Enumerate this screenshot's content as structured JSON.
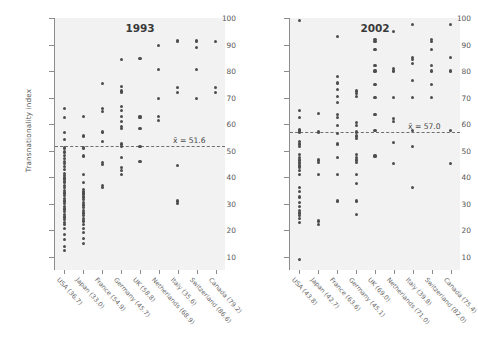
{
  "figure": {
    "ylabel": "Transnationality index",
    "y_ticks": [
      10,
      20,
      30,
      40,
      50,
      60,
      70,
      80,
      90,
      100
    ]
  },
  "chart_data": {
    "type": "scatter",
    "xlabel": "",
    "ylabel": "Transnationality index",
    "ylim": [
      5,
      100
    ],
    "grid": false,
    "legend": "none",
    "panels": [
      {
        "title": "1993",
        "mean": 51.6,
        "mean_label": "x̄ = 51.6",
        "categories": [
          "USA (36.7)",
          "Japan (33.0)",
          "France (54.9)",
          "Germany (45.7)",
          "UK (58.8)",
          "Netherlands (68.9)",
          "Italy (35.6)",
          "Switzerland (86.6)",
          "Canada (79.2)"
        ],
        "series": [
          {
            "name": "USA (36.7)",
            "values": [
              66.0,
              62.5,
              56.8,
              54.2,
              51.0,
              49.5,
              48.3,
              47.0,
              46.0,
              45.0,
              44.0,
              43.0,
              41.5,
              40.5,
              40.0,
              39.5,
              39.0,
              38.2,
              37.0,
              36.0,
              35.0,
              34.0,
              33.2,
              32.0,
              31.0,
              30.0,
              29.0,
              28.0,
              27.0,
              26.0,
              25.0,
              24.0,
              23.0,
              22.0,
              20.5,
              18.5,
              16.5,
              14.0,
              12.5
            ]
          },
          {
            "name": "Japan (33.0)",
            "values": [
              63.0,
              55.5,
              51.0,
              48.0,
              41.0,
              38.0,
              35.5,
              34.5,
              34.0,
              33.5,
              32.5,
              31.5,
              30.5,
              29.5,
              28.5,
              27.5,
              26.5,
              25.5,
              24.5,
              23.5,
              22.0,
              20.5,
              19.0,
              17.0,
              15.0
            ]
          },
          {
            "name": "France (54.9)",
            "values": [
              75.4,
              66.0,
              64.8,
              57.0,
              53.5,
              45.5,
              44.8,
              37.0,
              36.0
            ]
          },
          {
            "name": "Germany (45.7)",
            "values": [
              84.3,
              74.3,
              72.5,
              71.8,
              66.5,
              65.0,
              63.0,
              61.0,
              59.0,
              58.2,
              52.5,
              51.5,
              47.5,
              43.5,
              42.5,
              41.0
            ]
          },
          {
            "name": "UK (58.8)",
            "values": [
              84.6,
              63.0,
              62.5,
              58.3,
              51.5,
              45.8
            ]
          },
          {
            "name": "Netherlands (68.9)",
            "values": [
              89.5,
              80.6,
              69.5,
              63.0,
              61.5
            ]
          },
          {
            "name": "Italy (35.6)",
            "values": [
              91.5,
              91.0,
              73.9,
              72.0,
              44.5,
              31.0,
              30.0
            ]
          },
          {
            "name": "Switzerland (86.6)",
            "values": [
              91.5,
              91.0,
              89.0,
              80.6,
              69.5
            ]
          },
          {
            "name": "Canada (79.2)",
            "values": [
              91.0,
              73.9,
              72.0
            ]
          }
        ]
      },
      {
        "title": "2002",
        "mean": 57.0,
        "mean_label": "x̄ = 57.0",
        "categories": [
          "USA (43.8)",
          "Japan (42.7)",
          "France (63.6)",
          "Germany (45.1)",
          "UK (69.0)",
          "Netherlands (71.0)",
          "Italy (39.8)",
          "Switzerland (82.0)",
          "Canada (75.4)"
        ],
        "series": [
          {
            "name": "USA (43.8)",
            "values": [
              99.0,
              65.0,
              62.5,
              58.0,
              57.5,
              57.0,
              53.5,
              52.5,
              51.5,
              48.5,
              47.5,
              46.5,
              45.5,
              45.0,
              44.5,
              44.0,
              43.5,
              42.5,
              41.0,
              36.0,
              34.5,
              32.5,
              30.5,
              29.0,
              27.5,
              26.5,
              25.5,
              24.5,
              23.0,
              9.0
            ]
          },
          {
            "name": "Japan (42.7)",
            "values": [
              64.0,
              57.0,
              46.5,
              45.5,
              41.0,
              23.5,
              22.0
            ]
          },
          {
            "name": "France (63.6)",
            "values": [
              93.0,
              78.0,
              75.5,
              73.0,
              70.5,
              68.0,
              63.5,
              62.5,
              59.5,
              56.5,
              52.5,
              47.5,
              41.0,
              31.0
            ]
          },
          {
            "name": "Germany (45.1)",
            "values": [
              72.5,
              71.5,
              70.5,
              60.5,
              59.5,
              57.0,
              55.5,
              54.5,
              48.5,
              47.5,
              46.5,
              45.5,
              41.0,
              37.5,
              31.0,
              26.0
            ]
          },
          {
            "name": "UK (69.0)",
            "values": [
              92.0,
              91.0,
              88.0,
              82.0,
              80.0,
              75.0,
              70.0,
              63.5,
              57.5,
              48.0
            ]
          },
          {
            "name": "Netherlands (71.0)",
            "values": [
              95.0,
              81.0,
              80.0,
              70.0,
              62.0,
              61.0,
              53.0,
              45.0
            ]
          },
          {
            "name": "Italy (39.8)",
            "values": [
              97.5,
              85.0,
              84.5,
              83.0,
              76.5,
              70.0,
              57.5,
              51.5,
              36.0
            ]
          },
          {
            "name": "Switzerland (82.0)",
            "values": [
              92.0,
              91.0,
              88.0,
              82.0,
              80.0,
              75.0,
              70.0
            ]
          },
          {
            "name": "Canada (75.4)",
            "values": [
              97.5,
              85.0,
              80.0,
              57.5,
              45.0
            ]
          }
        ]
      }
    ]
  }
}
